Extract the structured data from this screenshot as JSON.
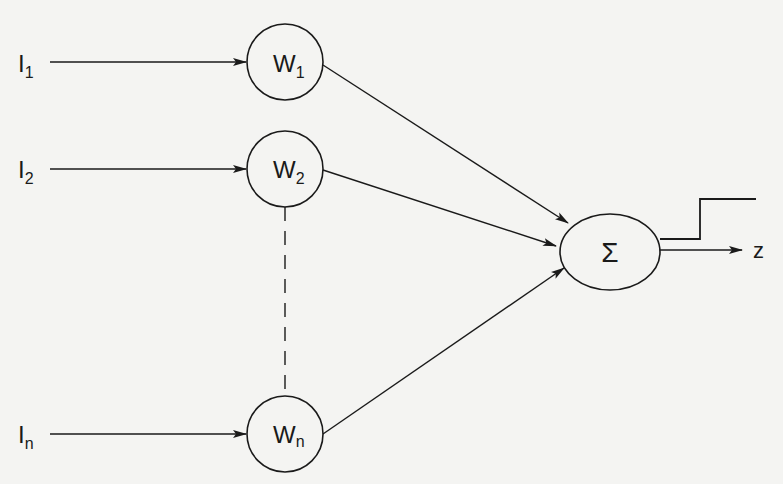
{
  "diagram": {
    "type": "perceptron",
    "inputs": [
      {
        "label": "I",
        "sub": "1"
      },
      {
        "label": "I",
        "sub": "2"
      },
      {
        "label": "I",
        "sub": "n"
      }
    ],
    "weights": [
      {
        "label": "W",
        "sub": "1"
      },
      {
        "label": "W",
        "sub": "2"
      },
      {
        "label": "W",
        "sub": "n"
      }
    ],
    "summation": {
      "symbol": "Σ"
    },
    "output": {
      "label": "z"
    },
    "colors": {
      "line": "#1a1a1a",
      "background": "#f4f4f2"
    }
  }
}
